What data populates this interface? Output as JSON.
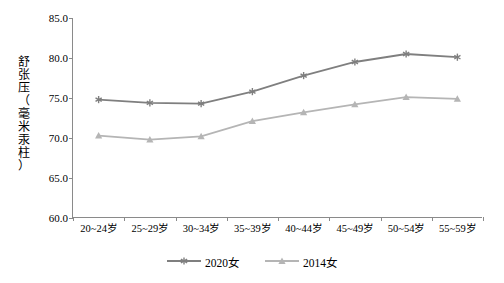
{
  "chart_data": {
    "type": "line",
    "title": "",
    "xlabel": "",
    "ylabel": "舒张压（毫米汞柱）",
    "categories": [
      "20~24岁",
      "25~29岁",
      "30~34岁",
      "35~39岁",
      "40~44岁",
      "45~49岁",
      "50~54岁",
      "55~59岁"
    ],
    "ylim": [
      60.0,
      85.0
    ],
    "ytick_labels": [
      "60.0",
      "65.0",
      "70.0",
      "75.0",
      "80.0",
      "85.0"
    ],
    "yticks": [
      60.0,
      65.0,
      70.0,
      75.0,
      80.0,
      85.0
    ],
    "grid": false,
    "legend_position": "bottom",
    "series": [
      {
        "name": "2020女",
        "color": "#7f7f7f",
        "marker": "asterisk",
        "values": [
          74.8,
          74.4,
          74.3,
          75.8,
          77.8,
          79.5,
          80.5,
          80.1
        ]
      },
      {
        "name": "2014女",
        "color": "#b5b5b5",
        "marker": "triangle",
        "values": [
          70.3,
          69.8,
          70.2,
          72.1,
          73.2,
          74.2,
          75.1,
          74.9
        ]
      }
    ]
  },
  "legend": {
    "items": [
      {
        "label": "2020女"
      },
      {
        "label": "2014女"
      }
    ]
  },
  "axis": {
    "y_title_chars": [
      "舒",
      "张",
      "压",
      "（",
      "毫",
      "米",
      "汞",
      "柱",
      "）"
    ]
  }
}
